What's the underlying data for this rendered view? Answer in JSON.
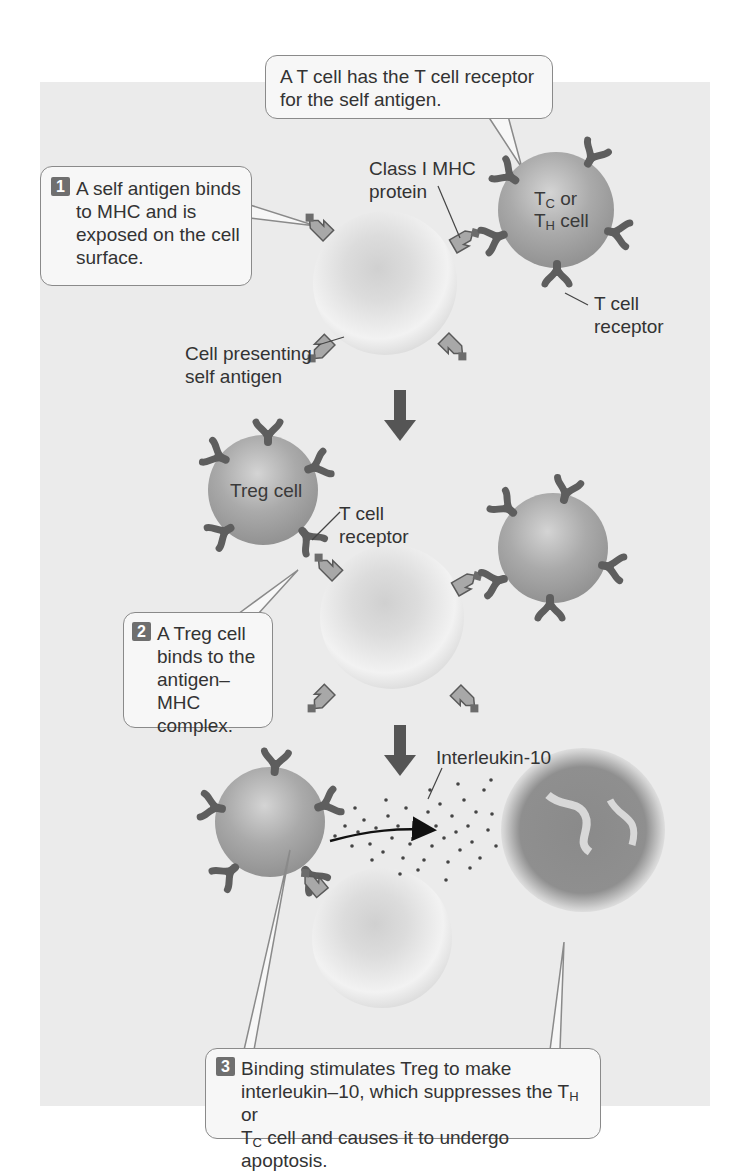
{
  "figure": {
    "colors": {
      "panel_bg": "#ebebeb",
      "callout_bg": "#f7f7f7",
      "callout_border": "#8a8a8a",
      "presenting_cell": "#e6e6e6",
      "t_cell": "#a8a8a8",
      "receptor": "#6a6a6a",
      "mhc_protein": "#a0a0a0",
      "arrow": "#555555",
      "step_badge": "#6f6f6f"
    },
    "callouts": {
      "top": {
        "text": "A T cell has the T cell receptor for the self antigen."
      },
      "step1": {
        "number": "1",
        "text": "A self antigen binds to MHC and is exposed on the cell surface."
      },
      "step2": {
        "number": "2",
        "text": "A Treg cell binds to the antigen–MHC complex."
      },
      "step3": {
        "number": "3",
        "line1": "Binding stimulates Treg to make",
        "line2_pre": "interleukin–10, which suppresses the T",
        "line2_sub": "H",
        "line2_post": " or",
        "line3_pre": "T",
        "line3_sub": "C",
        "line3_post": " cell and causes it to undergo apoptosis."
      }
    },
    "labels": {
      "class1_mhc": "Class I MHC protein",
      "t_cell_receptor_1": "T cell receptor",
      "cell_presenting": "Cell presenting self antigen",
      "t_cell_receptor_2": "T cell receptor",
      "interleukin": "Interleukin-10"
    },
    "cells": {
      "tc_th": {
        "line1_pre": "T",
        "line1_sub": "C",
        "line1_post": " or",
        "line2_pre": "T",
        "line2_sub": "H",
        "line2_post": " cell"
      },
      "treg": "Treg cell"
    },
    "arrows": [
      "down-arrow",
      "down-arrow"
    ]
  }
}
